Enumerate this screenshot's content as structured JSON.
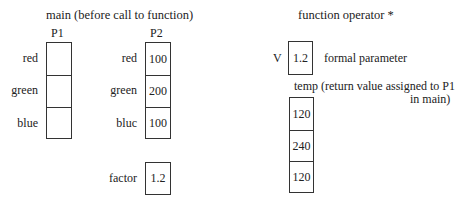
{
  "main": {
    "title": "main (before call to function)",
    "p1": {
      "label": "P1",
      "fields": [
        {
          "name": "red",
          "value": ""
        },
        {
          "name": "green",
          "value": ""
        },
        {
          "name": "blue",
          "value": ""
        }
      ]
    },
    "p2": {
      "label": "P2",
      "fields": [
        {
          "name": "red",
          "value": "100"
        },
        {
          "name": "green",
          "value": "200"
        },
        {
          "name": "bluc",
          "value": "100"
        }
      ]
    },
    "factor": {
      "label": "factor",
      "value": "1.2"
    }
  },
  "function": {
    "title": "function operator *",
    "v": {
      "label": "V",
      "value": "1.2",
      "note": "formal parameter"
    },
    "temp": {
      "caption_line1": "temp (return value assigned to P1",
      "caption_line2": "in main)",
      "values": [
        "120",
        "240",
        "120"
      ]
    }
  }
}
